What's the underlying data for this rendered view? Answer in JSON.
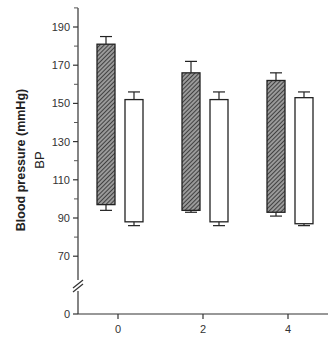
{
  "chart_data": {
    "type": "bar",
    "title": "",
    "xlabel": "",
    "ylabel": "Blood pressure (mmHg)",
    "ylabel_secondary": "BP",
    "categories": [
      "0",
      "2",
      "4"
    ],
    "ylim": [
      0,
      200
    ],
    "y_break": [
      0,
      70
    ],
    "yticks": [
      0,
      70,
      90,
      110,
      130,
      150,
      170,
      190
    ],
    "grid": false,
    "legend": null,
    "bar_style": "floating (range) bars with error bars at both ends",
    "series": [
      {
        "name": "hatched",
        "fill": "hatched",
        "top": [
          181,
          166,
          162
        ],
        "top_error": [
          185,
          172,
          166
        ],
        "bottom": [
          97,
          94,
          93
        ],
        "bottom_error": [
          94,
          93,
          91
        ]
      },
      {
        "name": "open",
        "fill": "white",
        "top": [
          152,
          152,
          153
        ],
        "top_error": [
          156,
          156,
          156
        ],
        "bottom": [
          88,
          88,
          87
        ],
        "bottom_error": [
          86,
          86,
          86
        ]
      }
    ]
  },
  "labels": {
    "ylabel": "Blood pressure (mmHg)",
    "ylabel_secondary": "BP",
    "yticks": [
      "190",
      "170",
      "150",
      "130",
      "110",
      "90",
      "70",
      "0"
    ],
    "xticks": [
      "0",
      "2",
      "4"
    ]
  }
}
